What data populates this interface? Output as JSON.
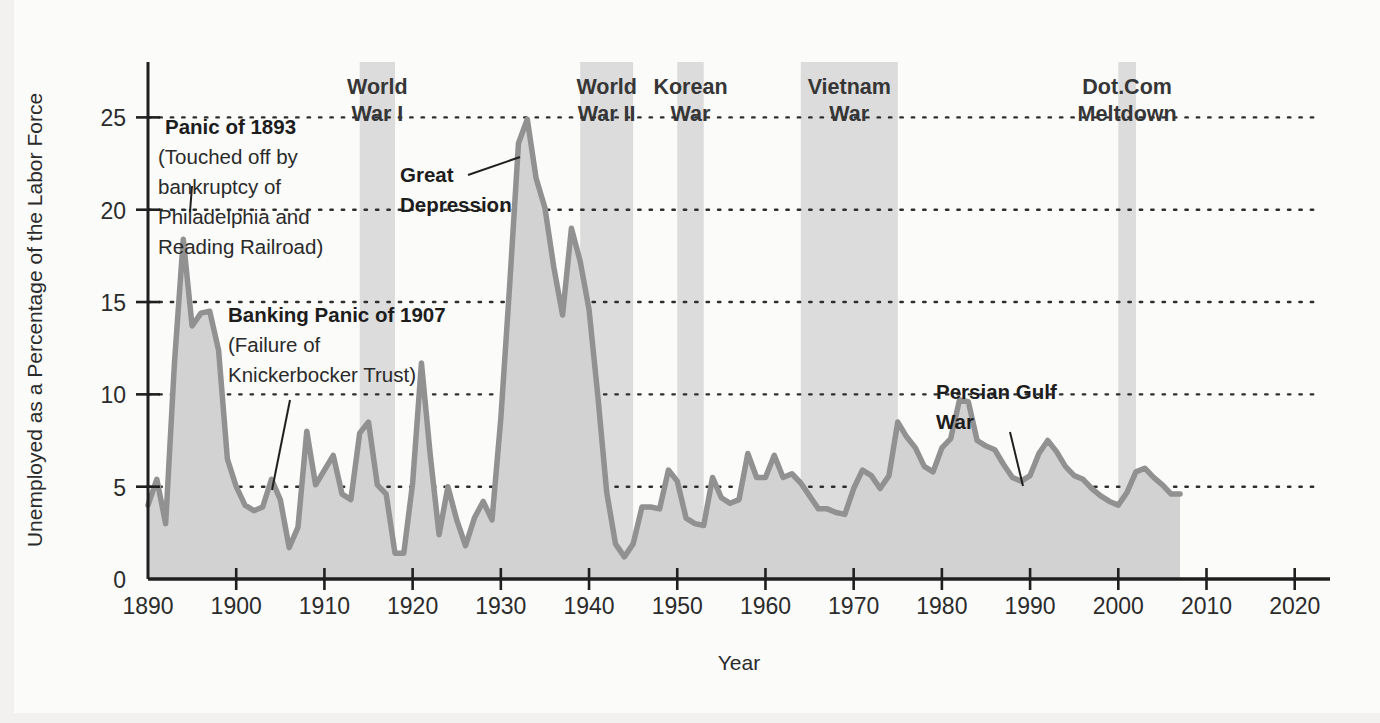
{
  "chart_data": {
    "type": "area",
    "title": "",
    "xlabel": "Year",
    "ylabel": "Unemployed as a Percentage of the Labor Force",
    "xlim": [
      1890,
      2024
    ],
    "ylim": [
      0,
      28
    ],
    "xticks": [
      1890,
      1900,
      1910,
      1920,
      1930,
      1940,
      1950,
      1960,
      1970,
      1980,
      1990,
      2000,
      2010,
      2020
    ],
    "yticks": [
      0,
      5,
      10,
      15,
      20,
      25
    ],
    "grid": "horizontal-dotted",
    "legend": "none",
    "line_color": "#8c8c8c",
    "fill_color": "#d2d2d2",
    "band_color": "#dcdcdc",
    "series": [
      {
        "name": "Unemployment rate",
        "x": [
          1890,
          1891,
          1892,
          1893,
          1894,
          1895,
          1896,
          1897,
          1898,
          1899,
          1900,
          1901,
          1902,
          1903,
          1904,
          1905,
          1906,
          1907,
          1908,
          1909,
          1910,
          1911,
          1912,
          1913,
          1914,
          1915,
          1916,
          1917,
          1918,
          1919,
          1920,
          1921,
          1922,
          1923,
          1924,
          1925,
          1926,
          1927,
          1928,
          1929,
          1930,
          1931,
          1932,
          1933,
          1934,
          1935,
          1936,
          1937,
          1938,
          1939,
          1940,
          1941,
          1942,
          1943,
          1944,
          1945,
          1946,
          1947,
          1948,
          1949,
          1950,
          1951,
          1952,
          1953,
          1954,
          1955,
          1956,
          1957,
          1958,
          1959,
          1960,
          1961,
          1962,
          1963,
          1964,
          1965,
          1966,
          1967,
          1968,
          1969,
          1970,
          1971,
          1972,
          1973,
          1974,
          1975,
          1976,
          1977,
          1978,
          1979,
          1980,
          1981,
          1982,
          1983,
          1984,
          1985,
          1986,
          1987,
          1988,
          1989,
          1990,
          1991,
          1992,
          1993,
          1994,
          1995,
          1996,
          1997,
          1998,
          1999,
          2000,
          2001,
          2002,
          2003,
          2004,
          2005,
          2006,
          2007
        ],
        "values": [
          4.0,
          5.4,
          3.0,
          11.7,
          18.4,
          13.7,
          14.4,
          14.5,
          12.4,
          6.5,
          5.0,
          4.0,
          3.7,
          3.9,
          5.4,
          4.3,
          1.7,
          2.8,
          8.0,
          5.1,
          5.9,
          6.7,
          4.6,
          4.3,
          7.9,
          8.5,
          5.1,
          4.6,
          1.4,
          1.4,
          5.2,
          11.7,
          6.7,
          2.4,
          5.0,
          3.2,
          1.8,
          3.3,
          4.2,
          3.2,
          8.7,
          15.9,
          23.6,
          24.9,
          21.7,
          20.1,
          16.9,
          14.3,
          19.0,
          17.2,
          14.6,
          9.9,
          4.7,
          1.9,
          1.2,
          1.9,
          3.9,
          3.9,
          3.8,
          5.9,
          5.3,
          3.3,
          3.0,
          2.9,
          5.5,
          4.4,
          4.1,
          4.3,
          6.8,
          5.5,
          5.5,
          6.7,
          5.5,
          5.7,
          5.2,
          4.5,
          3.8,
          3.8,
          3.6,
          3.5,
          4.9,
          5.9,
          5.6,
          4.9,
          5.6,
          8.5,
          7.7,
          7.1,
          6.1,
          5.8,
          7.1,
          7.6,
          9.7,
          9.6,
          7.5,
          7.2,
          7.0,
          6.2,
          5.5,
          5.3,
          5.6,
          6.8,
          7.5,
          6.9,
          6.1,
          5.6,
          5.4,
          4.9,
          4.5,
          4.2,
          4.0,
          4.7,
          5.8,
          6.0,
          5.5,
          5.1,
          4.6,
          4.6
        ]
      }
    ],
    "shaded_periods": [
      {
        "label_line1": "World",
        "label_line2": "War I",
        "start": 1914,
        "end": 1918
      },
      {
        "label_line1": "World",
        "label_line2": "War II",
        "start": 1939,
        "end": 1945
      },
      {
        "label_line1": "Korean",
        "label_line2": "War",
        "start": 1950,
        "end": 1953
      },
      {
        "label_line1": "Vietnam",
        "label_line2": "War",
        "start": 1964,
        "end": 1975
      },
      {
        "label_line1": "Dot.Com",
        "label_line2": "Meltdown",
        "start": 2000,
        "end": 2002
      }
    ],
    "annotations": [
      {
        "id": "panic-1893",
        "lines": [
          "Panic of 1893",
          "(Touched off by",
          "bankruptcy of",
          "Philadelphia and",
          "Reading Railroad)"
        ],
        "bold_first_line": true
      },
      {
        "id": "banking-panic-1907",
        "lines": [
          "Banking Panic of 1907",
          "(Failure of",
          "Knickerbocker Trust)"
        ],
        "bold_first_line": true
      },
      {
        "id": "great-depression",
        "lines": [
          "Great",
          "Depression"
        ],
        "bold_first_line": true
      },
      {
        "id": "persian-gulf-war",
        "lines": [
          "Persian Gulf",
          "War"
        ],
        "bold_first_line": true
      }
    ]
  }
}
